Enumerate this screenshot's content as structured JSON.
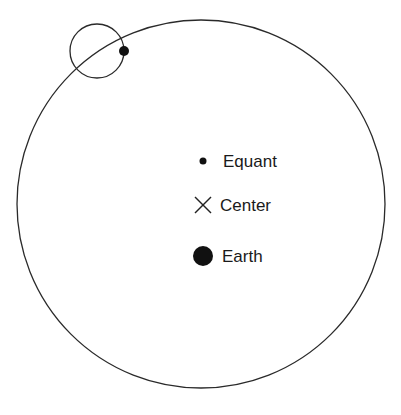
{
  "diagram": {
    "colors": {
      "stroke": "#2a2a2a",
      "fill": "#111111",
      "background": "#ffffff"
    },
    "deferent": {
      "cx": 201,
      "cy": 204,
      "r": 184
    },
    "epicycle": {
      "cx": 97,
      "cy": 51,
      "r": 27
    },
    "planet": {
      "cx": 124,
      "cy": 50,
      "r": 5
    },
    "labels": {
      "equant": "Equant",
      "center": "Center",
      "earth": "Earth"
    }
  }
}
